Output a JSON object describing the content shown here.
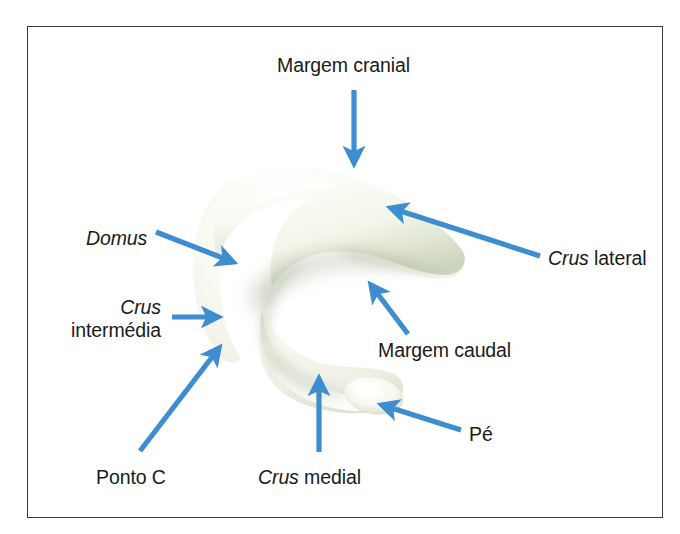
{
  "figure": {
    "kind": "anatomical-illustration",
    "frame": {
      "border_color": "#3a3a3a",
      "background_color": "#ffffff"
    },
    "specimen": {
      "name": "alar-cartilage-model",
      "fill_color": "#fbfcf7",
      "shade_color": "#b9c0ad",
      "highlight_color": "#ffffff"
    },
    "arrow_color": "#3d8dd0",
    "text_color": "#1a1a1a"
  },
  "annotations": [
    {
      "id": "margem-cranial",
      "lines": [
        {
          "text": "Margem cranial",
          "italic": false
        }
      ],
      "text_x": 277,
      "text_y": 54,
      "align": "left",
      "arrow": {
        "x1": 354,
        "y1": 90,
        "x2": 354,
        "y2": 163
      }
    },
    {
      "id": "domus",
      "lines": [
        {
          "text": "Domus",
          "italic": true
        }
      ],
      "text_x": 86,
      "text_y": 227,
      "align": "left",
      "arrow": {
        "x1": 156,
        "y1": 232,
        "x2": 233,
        "y2": 262
      }
    },
    {
      "id": "crus-lateral",
      "lines": [
        {
          "text": "Crus",
          "italic": true
        },
        {
          "text": " lateral",
          "italic": false
        }
      ],
      "inline": true,
      "text_x": 548,
      "text_y": 247,
      "align": "left",
      "arrow": {
        "x1": 540,
        "y1": 256,
        "x2": 391,
        "y2": 208
      }
    },
    {
      "id": "crus-intermedia",
      "lines": [
        {
          "text": "Crus",
          "italic": true
        },
        {
          "text": "intermédia",
          "italic": false
        }
      ],
      "text_x": 48,
      "text_y": 296,
      "align": "right",
      "box_width": 113,
      "arrow": {
        "x1": 172,
        "y1": 317,
        "x2": 218,
        "y2": 317
      }
    },
    {
      "id": "margem-caudal",
      "lines": [
        {
          "text": "Margem caudal",
          "italic": false
        }
      ],
      "text_x": 378,
      "text_y": 339,
      "align": "left",
      "arrow": {
        "x1": 408,
        "y1": 334,
        "x2": 371,
        "y2": 285
      }
    },
    {
      "id": "pe",
      "lines": [
        {
          "text": "Pé",
          "italic": false
        }
      ],
      "text_x": 469,
      "text_y": 423,
      "align": "left",
      "arrow": {
        "x1": 461,
        "y1": 430,
        "x2": 382,
        "y2": 405
      }
    },
    {
      "id": "ponto-c",
      "lines": [
        {
          "text": "Ponto C",
          "italic": false
        }
      ],
      "text_x": 96,
      "text_y": 466,
      "align": "left",
      "arrow": {
        "x1": 140,
        "y1": 451,
        "x2": 219,
        "y2": 348
      }
    },
    {
      "id": "crus-medial",
      "lines": [
        {
          "text": "Crus",
          "italic": true
        },
        {
          "text": " medial",
          "italic": false
        }
      ],
      "inline": true,
      "text_x": 258,
      "text_y": 466,
      "align": "left",
      "arrow": {
        "x1": 319,
        "y1": 452,
        "x2": 319,
        "y2": 379
      }
    }
  ]
}
